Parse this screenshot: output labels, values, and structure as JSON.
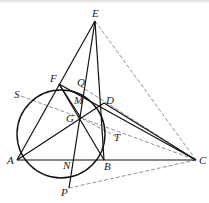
{
  "figure": {
    "type": "geometry",
    "circle": {
      "cx": 61,
      "cy": 134,
      "r": 44
    },
    "points": {
      "E": {
        "x": 95,
        "y": 21,
        "label": "E",
        "lx": 92,
        "ly": 17
      },
      "F": {
        "x": 59,
        "y": 84,
        "label": "F",
        "lx": 50,
        "ly": 82
      },
      "Q": {
        "x": 85,
        "y": 89,
        "label": "Q",
        "lx": 77,
        "ly": 86
      },
      "D": {
        "x": 104,
        "y": 103,
        "label": "D",
        "lx": 106,
        "ly": 104
      },
      "S": {
        "x": 21,
        "y": 96,
        "label": "S",
        "lx": 14,
        "ly": 98
      },
      "M": {
        "x": 84,
        "y": 100,
        "label": "M",
        "lx": 74,
        "ly": 104
      },
      "G": {
        "x": 81,
        "y": 118,
        "label": "G",
        "lx": 66,
        "ly": 122
      },
      "T": {
        "x": 119,
        "y": 138,
        "label": "T",
        "lx": 114,
        "ly": 141
      },
      "A": {
        "x": 17,
        "y": 160,
        "label": "A",
        "lx": 7,
        "ly": 164
      },
      "N": {
        "x": 73,
        "y": 160,
        "label": "N",
        "lx": 63,
        "ly": 169
      },
      "B": {
        "x": 104,
        "y": 160,
        "label": "B",
        "lx": 104,
        "ly": 170
      },
      "C": {
        "x": 196,
        "y": 160,
        "label": "C",
        "lx": 199,
        "ly": 164
      },
      "P": {
        "x": 69,
        "y": 188,
        "label": "P",
        "lx": 61,
        "ly": 196
      }
    },
    "solid_segments": [
      [
        "E",
        "A"
      ],
      [
        "E",
        "B"
      ],
      [
        "E",
        "P"
      ],
      [
        "A",
        "C"
      ],
      [
        "A",
        "D"
      ],
      [
        "F",
        "B"
      ],
      [
        "F",
        "C"
      ],
      [
        "D",
        "C"
      ],
      [
        "F",
        "G"
      ]
    ],
    "dashed_segments": [
      [
        "E",
        "C"
      ],
      [
        "S",
        "C"
      ],
      [
        "G",
        "T"
      ],
      [
        "P",
        "C"
      ],
      [
        "Q",
        "C"
      ]
    ]
  }
}
